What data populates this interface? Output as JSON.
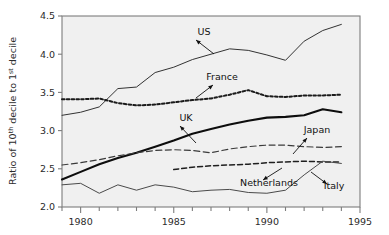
{
  "chart_data": {
    "type": "line",
    "title": "",
    "xlabel": "",
    "ylabel_parts": {
      "p1": "Ratio of 10",
      "sup1": "th",
      "p2": " decile to 1",
      "sup2": "st",
      "p3": " decile"
    },
    "ylabel": "Ratio of 10th decile to 1st decile",
    "xlim": [
      1979,
      1995
    ],
    "ylim": [
      2.0,
      4.5
    ],
    "ytick_values": [
      2.0,
      2.5,
      3.0,
      3.5,
      4.0,
      4.5
    ],
    "ytick_labels": [
      "2.0",
      "2.5",
      "3.0",
      "3.5",
      "4.0",
      "4.5"
    ],
    "xtick_values": [
      1980,
      1985,
      1990,
      1995
    ],
    "xtick_labels": [
      "1980",
      "1985",
      "1990",
      "1995"
    ],
    "xminor_values": [
      1979,
      1980,
      1981,
      1982,
      1983,
      1984,
      1985,
      1986,
      1987,
      1988,
      1989,
      1990,
      1991,
      1992,
      1993,
      1994,
      1995
    ],
    "grid": false,
    "legend_position": "inline-annotations",
    "plot_bg": "#f0f0f0",
    "border_color": "#7d7d7d",
    "series": [
      {
        "name": "US",
        "style": "thin-solid",
        "color": "#333333",
        "x": [
          1979,
          1980,
          1981,
          1982,
          1983,
          1984,
          1985,
          1986,
          1987,
          1988,
          1989,
          1990,
          1991,
          1992,
          1993,
          1994
        ],
        "values": [
          3.2,
          3.24,
          3.31,
          3.55,
          3.57,
          3.76,
          3.83,
          3.93,
          4.0,
          4.07,
          4.05,
          3.99,
          3.92,
          4.17,
          4.31,
          4.39
        ]
      },
      {
        "name": "France",
        "style": "bold-dotted",
        "color": "#1a1a1a",
        "x": [
          1979,
          1980,
          1981,
          1982,
          1983,
          1984,
          1985,
          1986,
          1987,
          1988,
          1989,
          1990,
          1991,
          1992,
          1993,
          1994
        ],
        "values": [
          3.41,
          3.41,
          3.42,
          3.36,
          3.33,
          3.34,
          3.37,
          3.4,
          3.42,
          3.47,
          3.53,
          3.45,
          3.44,
          3.46,
          3.46,
          3.47
        ]
      },
      {
        "name": "UK",
        "style": "thick-solid",
        "color": "#0d0d0d",
        "x": [
          1979,
          1980,
          1981,
          1982,
          1983,
          1984,
          1985,
          1986,
          1987,
          1988,
          1989,
          1990,
          1991,
          1992,
          1993,
          1994
        ],
        "values": [
          2.36,
          2.46,
          2.56,
          2.64,
          2.71,
          2.79,
          2.87,
          2.96,
          3.02,
          3.08,
          3.13,
          3.17,
          3.18,
          3.2,
          3.28,
          3.24
        ]
      },
      {
        "name": "Japan",
        "style": "long-dash",
        "color": "#3a3a3a",
        "x": [
          1979,
          1980,
          1981,
          1982,
          1983,
          1984,
          1985,
          1986,
          1987,
          1988,
          1989,
          1990,
          1991,
          1992,
          1993,
          1994
        ],
        "values": [
          2.55,
          2.58,
          2.62,
          2.67,
          2.71,
          2.74,
          2.75,
          2.74,
          2.71,
          2.76,
          2.79,
          2.81,
          2.81,
          2.79,
          2.78,
          2.79
        ]
      },
      {
        "name": "Netherlands",
        "style": "medium-dash",
        "color": "#1f1f1f",
        "x": [
          1985,
          1986,
          1987,
          1988,
          1989,
          1990,
          1991,
          1992,
          1993,
          1994
        ],
        "values": [
          2.49,
          2.52,
          2.54,
          2.55,
          2.56,
          2.58,
          2.59,
          2.6,
          2.59,
          2.59
        ]
      },
      {
        "name": "Italy",
        "style": "thin-solid",
        "color": "#4a4a4a",
        "x": [
          1979,
          1980,
          1981,
          1982,
          1983,
          1984,
          1985,
          1986,
          1987,
          1988,
          1989,
          1990,
          1991,
          1992,
          1993,
          1994
        ],
        "values": [
          2.29,
          2.31,
          2.18,
          2.29,
          2.22,
          2.29,
          2.26,
          2.2,
          2.22,
          2.23,
          2.19,
          2.18,
          2.22,
          2.42,
          2.6,
          2.57
        ]
      }
    ],
    "annotations": [
      {
        "label": "US",
        "lx": 204,
        "ly": 35,
        "ax": 196,
        "ay": 40,
        "tx": 214,
        "ty": 54
      },
      {
        "label": "France",
        "lx": 222,
        "ly": 80,
        "ax": 213,
        "ay": 85,
        "tx": 196,
        "ty": 98
      },
      {
        "label": "UK",
        "lx": 186,
        "ly": 121,
        "ax": 180,
        "ay": 126,
        "tx": 196,
        "ty": 143
      },
      {
        "label": "Japan",
        "lx": 317,
        "ly": 133,
        "ax": 307,
        "ay": 138,
        "tx": 293,
        "ty": 154
      },
      {
        "label": "Netherlands",
        "lx": 269,
        "ly": 186,
        "ax": 263,
        "ay": 180,
        "tx": 282,
        "ty": 168
      },
      {
        "label": "Italy",
        "lx": 334,
        "ly": 189,
        "ax": 327,
        "ay": 184,
        "tx": 311,
        "ty": 172
      }
    ]
  }
}
